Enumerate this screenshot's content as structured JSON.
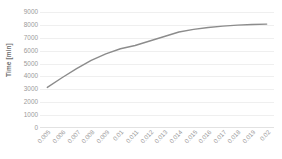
{
  "chart_data": {
    "type": "line",
    "title": "",
    "xlabel": "",
    "ylabel": "Time [min]",
    "x": [
      0.005,
      0.006,
      0.007,
      0.008,
      0.009,
      0.01,
      0.011,
      0.012,
      0.013,
      0.014,
      0.015,
      0.016,
      0.017,
      0.018,
      0.019,
      0.02
    ],
    "xtick_labels": [
      "0.005",
      "0.006",
      "0.007",
      "0.008",
      "0.009",
      "0.01",
      "0.011",
      "0.012",
      "0.013",
      "0.014",
      "0.015",
      "0.016",
      "0.017",
      "0.018",
      "0.019",
      "0.02"
    ],
    "values": [
      3150,
      3900,
      4600,
      5250,
      5750,
      6150,
      6400,
      6750,
      7100,
      7450,
      7650,
      7800,
      7900,
      7980,
      8030,
      8060
    ],
    "ytick_labels": [
      "0",
      "1000",
      "2000",
      "3000",
      "4000",
      "5000",
      "6000",
      "7000",
      "8000",
      "9000"
    ],
    "yticks": [
      0,
      1000,
      2000,
      3000,
      4000,
      5000,
      6000,
      7000,
      8000,
      9000
    ],
    "ylim": [
      0,
      9000
    ],
    "grid": true,
    "legend": "none",
    "series_color": "#8c8c8c",
    "grid_color": "#efefef"
  }
}
